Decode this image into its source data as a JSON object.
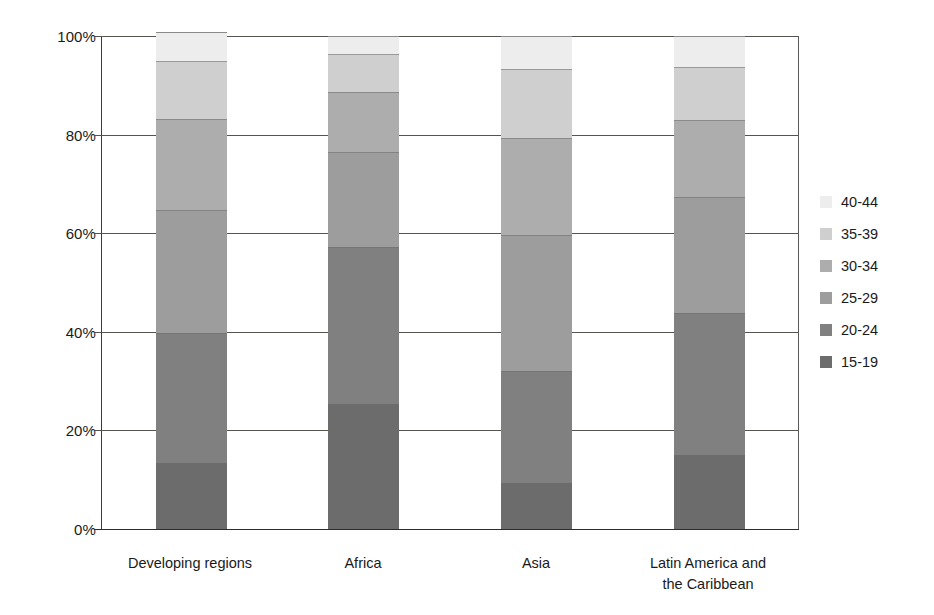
{
  "chart_data": {
    "type": "bar",
    "subtype": "stacked-percentage",
    "title": "",
    "subtitle": "",
    "xlabel": "",
    "ylabel": "",
    "ylim": [
      0,
      100
    ],
    "y_tick_labels": [
      "100%",
      "80%",
      "60%",
      "40%",
      "20%",
      "0%"
    ],
    "y_tick_values": [
      100,
      80,
      60,
      40,
      20,
      0
    ],
    "grid": true,
    "legend_position": "right",
    "categories": [
      "Developing regions",
      "Africa",
      "Asia",
      "Latin America and the Caribbean"
    ],
    "category_label_lines": [
      [
        "Developing regions"
      ],
      [
        "Africa"
      ],
      [
        "Asia"
      ],
      [
        "Latin America and",
        "the Caribbean"
      ]
    ],
    "series": [
      {
        "name": "15-19",
        "color": "#6c6c6c",
        "values": [
          13.4,
          25.4,
          9.3,
          15.0
        ]
      },
      {
        "name": "20-24",
        "color": "#808080",
        "values": [
          26.4,
          31.8,
          22.7,
          28.8
        ]
      },
      {
        "name": "25-29",
        "color": "#9d9d9d",
        "values": [
          24.9,
          19.3,
          27.6,
          23.5
        ]
      },
      {
        "name": "30-34",
        "color": "#adadad",
        "values": [
          18.5,
          12.2,
          19.7,
          15.6
        ]
      },
      {
        "name": "35-39",
        "color": "#cfcfcf",
        "values": [
          11.8,
          7.7,
          14.0,
          10.8
        ]
      },
      {
        "name": "40-44",
        "color": "#ededed",
        "values": [
          5.9,
          3.6,
          6.7,
          6.3
        ]
      }
    ],
    "legend_entries": [
      {
        "label": "40-44",
        "color": "#ededed"
      },
      {
        "label": "35-39",
        "color": "#cfcfcf"
      },
      {
        "label": "30-34",
        "color": "#adadad"
      },
      {
        "label": "25-29",
        "color": "#9d9d9d"
      },
      {
        "label": "20-24",
        "color": "#808080"
      },
      {
        "label": "15-19",
        "color": "#6c6c6c"
      }
    ]
  },
  "axis": {
    "tick_100": "100%",
    "tick_80": "80%",
    "tick_60": "60%",
    "tick_40": "40%",
    "tick_20": "20%",
    "tick_0": "0%"
  },
  "categories": {
    "c0_line0": "Developing regions",
    "c1_line0": "Africa",
    "c2_line0": "Asia",
    "c3_line0": "Latin America and",
    "c3_line1": "the Caribbean"
  },
  "legend": {
    "e0": "40-44",
    "e1": "35-39",
    "e2": "30-34",
    "e3": "25-29",
    "e4": "20-24",
    "e5": "15-19"
  },
  "colors": {
    "axis": "#2c2c2c",
    "grid": "#55554f",
    "text": "#1a1a1a",
    "background": "#ffffff"
  }
}
